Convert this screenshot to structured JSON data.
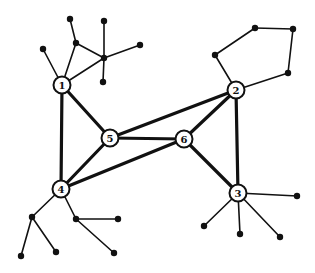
{
  "diagram": {
    "type": "graph",
    "labeled_nodes": [
      {
        "id": "1",
        "label": "1",
        "x": 62,
        "y": 85
      },
      {
        "id": "2",
        "label": "2",
        "x": 236,
        "y": 90
      },
      {
        "id": "3",
        "label": "3",
        "x": 238,
        "y": 193
      },
      {
        "id": "4",
        "label": "4",
        "x": 61,
        "y": 189
      },
      {
        "id": "5",
        "label": "5",
        "x": 110,
        "y": 138
      },
      {
        "id": "6",
        "label": "6",
        "x": 184,
        "y": 139
      }
    ],
    "leaf_nodes": [
      {
        "id": "a1",
        "x": 43,
        "y": 49
      },
      {
        "id": "a2",
        "x": 76,
        "y": 43
      },
      {
        "id": "a3",
        "x": 70,
        "y": 19
      },
      {
        "id": "a4",
        "x": 104,
        "y": 58
      },
      {
        "id": "a5",
        "x": 104,
        "y": 21
      },
      {
        "id": "a6",
        "x": 140,
        "y": 45
      },
      {
        "id": "a7",
        "x": 103,
        "y": 82
      },
      {
        "id": "b1",
        "x": 215,
        "y": 55
      },
      {
        "id": "b2",
        "x": 255,
        "y": 28
      },
      {
        "id": "b3",
        "x": 293,
        "y": 29
      },
      {
        "id": "b4",
        "x": 288,
        "y": 73
      },
      {
        "id": "c1",
        "x": 297,
        "y": 196
      },
      {
        "id": "c2",
        "x": 204,
        "y": 226
      },
      {
        "id": "c3",
        "x": 240,
        "y": 234
      },
      {
        "id": "c4",
        "x": 280,
        "y": 237
      },
      {
        "id": "d1",
        "x": 32,
        "y": 217
      },
      {
        "id": "d2",
        "x": 21,
        "y": 256
      },
      {
        "id": "d3",
        "x": 56,
        "y": 252
      },
      {
        "id": "d4",
        "x": 76,
        "y": 219
      },
      {
        "id": "d5",
        "x": 118,
        "y": 219
      },
      {
        "id": "d6",
        "x": 114,
        "y": 253
      }
    ],
    "thick_edges": [
      [
        "1",
        "4"
      ],
      [
        "1",
        "5"
      ],
      [
        "5",
        "2"
      ],
      [
        "5",
        "6"
      ],
      [
        "5",
        "4"
      ],
      [
        "6",
        "2"
      ],
      [
        "6",
        "4"
      ],
      [
        "6",
        "3"
      ],
      [
        "2",
        "3"
      ]
    ],
    "thin_edges": [
      [
        "1",
        "a1"
      ],
      [
        "1",
        "a2"
      ],
      [
        "a2",
        "a3"
      ],
      [
        "a2",
        "a4"
      ],
      [
        "1",
        "a4"
      ],
      [
        "a4",
        "a5"
      ],
      [
        "a4",
        "a6"
      ],
      [
        "a4",
        "a7"
      ],
      [
        "2",
        "b1"
      ],
      [
        "b1",
        "b2"
      ],
      [
        "b2",
        "b3"
      ],
      [
        "b3",
        "b4"
      ],
      [
        "b4",
        "2"
      ],
      [
        "3",
        "c1"
      ],
      [
        "3",
        "c2"
      ],
      [
        "3",
        "c3"
      ],
      [
        "3",
        "c4"
      ],
      [
        "4",
        "d1"
      ],
      [
        "d1",
        "d2"
      ],
      [
        "d1",
        "d3"
      ],
      [
        "4",
        "d4"
      ],
      [
        "d4",
        "d5"
      ],
      [
        "d4",
        "d6"
      ]
    ],
    "colors": {
      "stroke": "#111111",
      "node_fill": "#ffffff",
      "background": "#ffffff"
    }
  }
}
